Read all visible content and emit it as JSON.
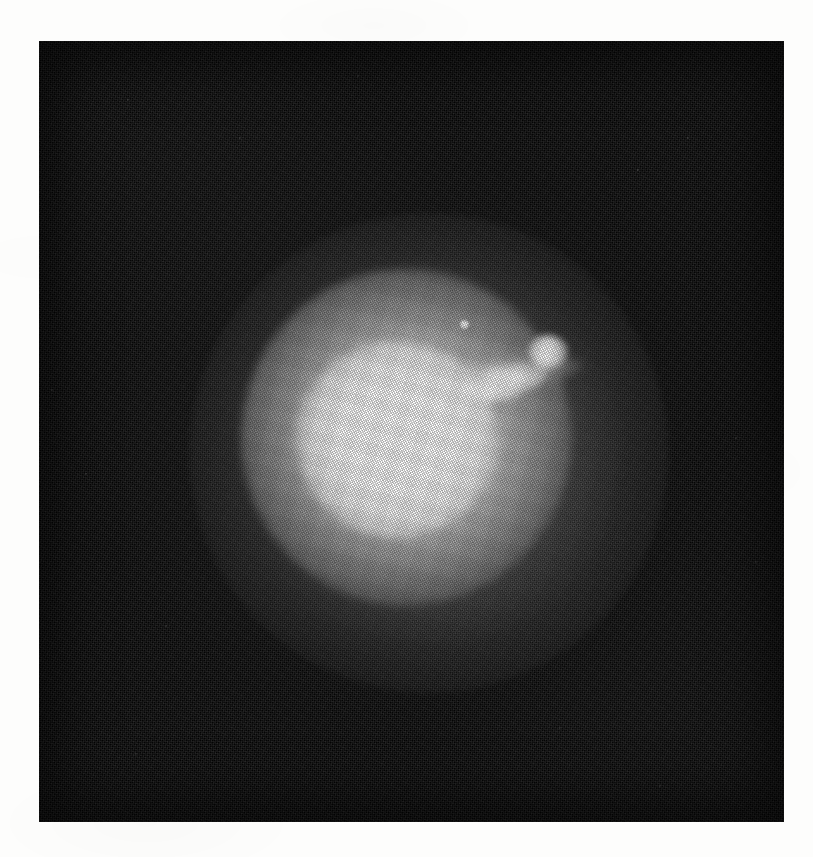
{
  "page": {
    "width": 813,
    "height": 857,
    "paper_color": "#fdfdfc",
    "kind": "scanned-photographic-plate"
  },
  "plate": {
    "name": "astronomical-photograph",
    "left": 39,
    "top": 41,
    "width": 745,
    "height": 781,
    "background_color": "#050505",
    "caption": ""
  },
  "subject": {
    "label": "",
    "description": "diffuse elliptical galaxy with relativistic jet",
    "core_color": "#ffffff",
    "halo_color": "#ffffff"
  },
  "features": [
    {
      "name": "galaxy-halo-outer",
      "cx": 390,
      "cy": 412,
      "rx": 240,
      "ry": 240,
      "brightness": 0.22
    },
    {
      "name": "galaxy-halo-mid",
      "cx": 367,
      "cy": 396,
      "rx": 165,
      "ry": 168,
      "brightness": 0.55
    },
    {
      "name": "galaxy-core",
      "cx": 358,
      "cy": 398,
      "rx": 100,
      "ry": 98,
      "brightness": 0.92
    },
    {
      "name": "galaxy-core-saturated",
      "cx": 355,
      "cy": 396,
      "rx": 59,
      "ry": 56,
      "brightness": 1.0
    },
    {
      "name": "jet-inner-streak",
      "cx": 465,
      "cy": 342,
      "rx": 46,
      "ry": 17,
      "angle": -17,
      "brightness": 0.95
    },
    {
      "name": "jet-outer-knot",
      "cx": 509,
      "cy": 311,
      "rx": 20,
      "ry": 17,
      "brightness": 0.96
    },
    {
      "name": "foreground-star",
      "cx": 425,
      "cy": 283,
      "rx": 4,
      "ry": 4,
      "brightness": 1.0
    }
  ],
  "field_specks": [
    {
      "x": 88,
      "y": 58,
      "s": 2,
      "a": 0.28
    },
    {
      "x": 200,
      "y": 96,
      "s": 1.6,
      "a": 0.22
    },
    {
      "x": 318,
      "y": 34,
      "s": 1.8,
      "a": 0.2
    },
    {
      "x": 598,
      "y": 128,
      "s": 2,
      "a": 0.3
    },
    {
      "x": 648,
      "y": 96,
      "s": 1.6,
      "a": 0.24
    },
    {
      "x": 700,
      "y": 141,
      "s": 1.4,
      "a": 0.2
    },
    {
      "x": 12,
      "y": 348,
      "s": 1.8,
      "a": 0.24
    },
    {
      "x": 46,
      "y": 432,
      "s": 2.4,
      "a": 0.3
    },
    {
      "x": 212,
      "y": 418,
      "s": 2,
      "a": 0.24
    },
    {
      "x": 268,
      "y": 452,
      "s": 1.6,
      "a": 0.22
    },
    {
      "x": 332,
      "y": 360,
      "s": 1.6,
      "a": 0.2
    },
    {
      "x": 696,
      "y": 396,
      "s": 2,
      "a": 0.26
    },
    {
      "x": 716,
      "y": 520,
      "s": 1.6,
      "a": 0.22
    },
    {
      "x": 126,
      "y": 584,
      "s": 1.6,
      "a": 0.2
    },
    {
      "x": 430,
      "y": 600,
      "s": 1.4,
      "a": 0.18
    },
    {
      "x": 520,
      "y": 686,
      "s": 1.8,
      "a": 0.24
    },
    {
      "x": 620,
      "y": 744,
      "s": 1.6,
      "a": 0.22
    },
    {
      "x": 96,
      "y": 712,
      "s": 1.6,
      "a": 0.2
    },
    {
      "x": 352,
      "y": 742,
      "s": 1.4,
      "a": 0.18
    },
    {
      "x": 664,
      "y": 626,
      "s": 1.4,
      "a": 0.18
    }
  ]
}
